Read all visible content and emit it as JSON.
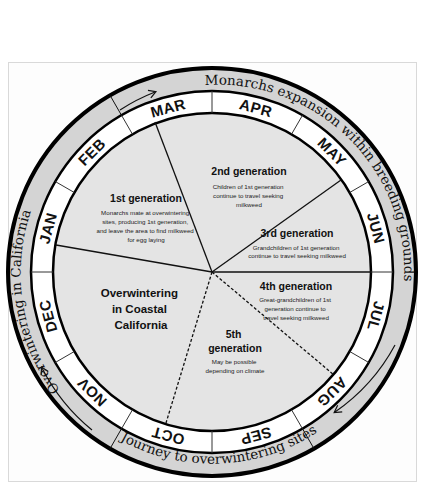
{
  "diagram": {
    "outer_ring_labels": {
      "breeding": "Monarchs expansion within breeding grounds",
      "journey": "Journey to overwintering sites",
      "overwintering": "Overwintering in California"
    },
    "months": [
      "JAN",
      "FEB",
      "MAR",
      "APR",
      "MAY",
      "JUN",
      "JUL",
      "AUG",
      "SEP",
      "OCT",
      "NOV",
      "DEC"
    ],
    "segments": {
      "overwintering": {
        "title_lines": [
          "Overwintering",
          "in Coastal",
          "California"
        ]
      },
      "gen1": {
        "title": "1st generation",
        "desc_lines": [
          "Monarchs mate at overwintering",
          "sites, producing 1st generation,",
          "and leave the area to find milkweed",
          "for egg laying"
        ]
      },
      "gen2": {
        "title": "2nd generation",
        "desc_lines": [
          "Children of 1st generation",
          "continue to travel seeking",
          "milkweed"
        ]
      },
      "gen3": {
        "title": "3rd generation",
        "desc_lines": [
          "Grandchildren of 1st generation",
          "continue to travel seeking milkweed"
        ]
      },
      "gen4": {
        "title": "4th generation",
        "desc_lines": [
          "Great-grandchildren of 1st",
          "generation continue to",
          "travel seeking milkweed"
        ]
      },
      "gen5": {
        "title_lines": [
          "5th",
          "generation"
        ],
        "desc_lines": [
          "May be possible",
          "depending on climate"
        ]
      }
    },
    "colors": {
      "ring_gray": "#d4d4d4",
      "inner_gray": "#e4e4e4",
      "month_ring": "#ffffff",
      "stroke": "#000000"
    }
  }
}
